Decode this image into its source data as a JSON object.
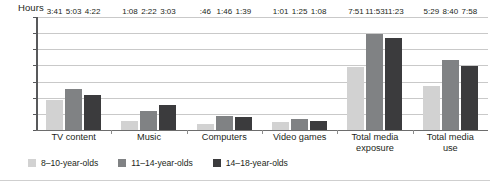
{
  "chart_data": {
    "type": "bar",
    "title": "",
    "xlabel": "",
    "ylabel": "Hours",
    "ylim": [
      0,
      14
    ],
    "yticks": [
      0,
      2,
      4,
      6,
      8,
      10,
      12,
      14
    ],
    "grid": true,
    "legend_position": "bottom",
    "categories": [
      "TV content",
      "Music",
      "Computers",
      "Video games",
      "Total media\nexposure",
      "Total media\nuse"
    ],
    "series": [
      {
        "name": "8–10-year-olds",
        "color": "#d2d2d2",
        "values": [
          3.683,
          1.133,
          0.767,
          1.017,
          7.85,
          5.483
        ],
        "labels": [
          "3:41",
          "1:08",
          ":46",
          "1:01",
          "7:51",
          "5:29"
        ]
      },
      {
        "name": "11–14-year-olds",
        "color": "#808284",
        "values": [
          5.05,
          2.367,
          1.767,
          1.417,
          11.883,
          8.667
        ],
        "labels": [
          "5:03",
          "2:22",
          "1:46",
          "1:25",
          "11:53",
          "8:40"
        ]
      },
      {
        "name": "14–18-year-olds",
        "color": "#3b3b3d",
        "values": [
          4.367,
          3.05,
          1.65,
          1.133,
          11.383,
          7.967
        ],
        "labels": [
          "4:22",
          "3:03",
          "1:39",
          "1:08",
          "11:23",
          "7:58"
        ]
      }
    ]
  }
}
